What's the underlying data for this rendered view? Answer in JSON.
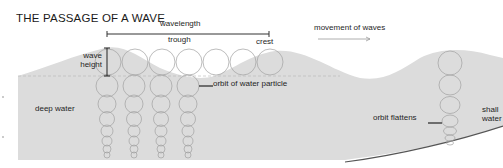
{
  "diagram": {
    "title": "THE PASSAGE OF A WAVE",
    "labels": {
      "wavelength": "wavelength",
      "trough": "trough",
      "crest": "crest",
      "movement": "movement of waves",
      "wave_height_line1": "wave",
      "wave_height_line2": "height",
      "orbit": "orbit of water particle",
      "deep_water": "deep water",
      "orbit_flattens": "orbit flattens",
      "shallow_line1": "shall",
      "shallow_line2": "water"
    },
    "colors": {
      "water": "#d9d9d9",
      "water_deep": "#e0e0e0",
      "line": "#333333",
      "circle": "#9a9a9a",
      "seabed": "#555555",
      "arrow": "#999999"
    }
  }
}
